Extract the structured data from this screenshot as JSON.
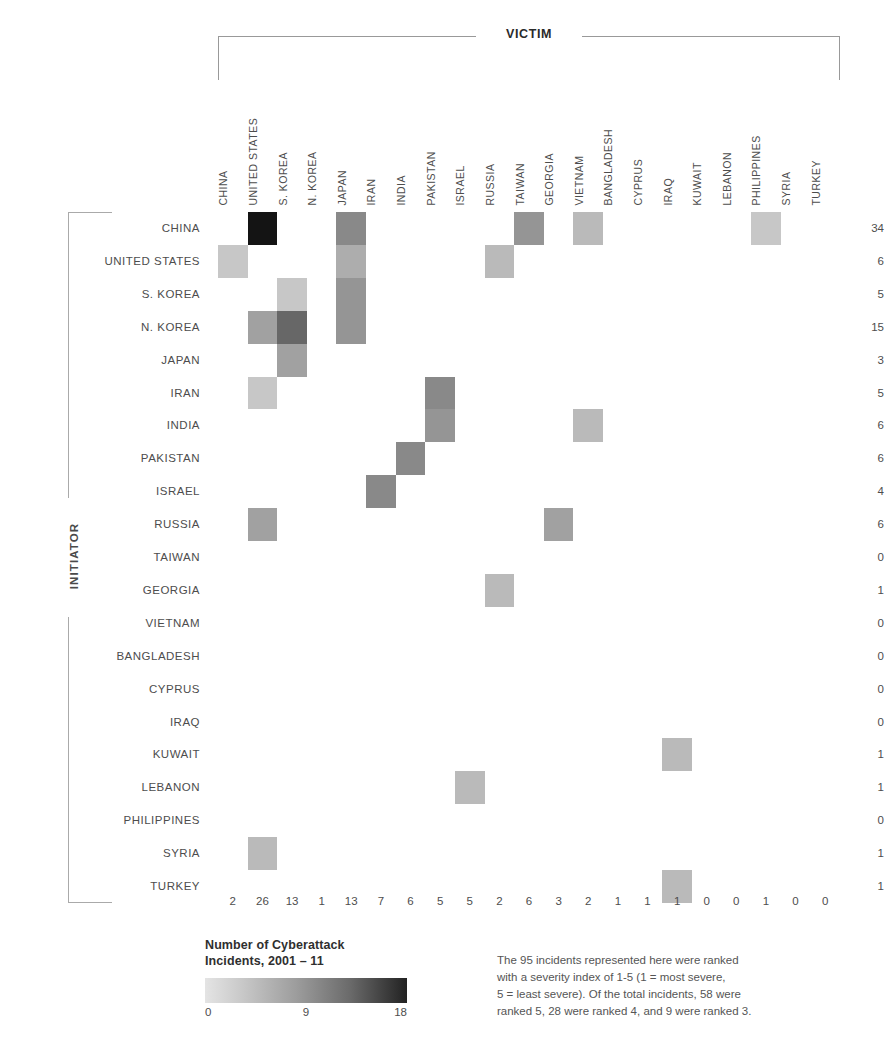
{
  "axes": {
    "victim_label": "VICTIM",
    "initiator_label": "INITIATOR"
  },
  "legend": {
    "title_line1": "Number of Cyberattack",
    "title_line2": "Incidents, 2001 – 11",
    "scale_min": "0",
    "scale_mid": "9",
    "scale_max": "18"
  },
  "footnote": {
    "line1": "The 95 incidents represented here were ranked",
    "line2": "with a severity index of 1-5 (1 = most severe,",
    "line3": "5 = least severe). Of the total incidents, 58 were",
    "line4": "ranked 5, 28 were ranked 4, and 9 were ranked 3."
  },
  "chart_data": {
    "type": "heatmap",
    "title": "Number of Cyberattack Incidents, 2001 – 11",
    "xlabel": "VICTIM",
    "ylabel": "INITIATOR",
    "grid": false,
    "legend_position": "bottom-left",
    "colorscale": {
      "min": 0,
      "mid": 9,
      "max": 18,
      "low_color": "#efefef",
      "high_color": "#1a1a1a"
    },
    "categories": [
      "CHINA",
      "UNITED STATES",
      "S. KOREA",
      "N. KOREA",
      "JAPAN",
      "IRAN",
      "INDIA",
      "PAKISTAN",
      "ISRAEL",
      "RUSSIA",
      "TAIWAN",
      "GEORGIA",
      "VIETNAM",
      "BANGLADESH",
      "CYPRUS",
      "IRAQ",
      "KUWAIT",
      "LEBANON",
      "PHILIPPINES",
      "SYRIA",
      "TURKEY"
    ],
    "rows": [
      "CHINA",
      "UNITED STATES",
      "S. KOREA",
      "N. KOREA",
      "JAPAN",
      "IRAN",
      "INDIA",
      "PAKISTAN",
      "ISRAEL",
      "RUSSIA",
      "TAIWAN",
      "GEORGIA",
      "VIETNAM",
      "BANGLADESH",
      "CYPRUS",
      "IRAQ",
      "KUWAIT",
      "LEBANON",
      "PHILIPPINES",
      "SYRIA",
      "TURKEY"
    ],
    "values": [
      [
        0,
        18,
        0,
        0,
        7,
        0,
        0,
        0,
        0,
        0,
        6,
        0,
        3,
        0,
        0,
        0,
        0,
        0,
        2,
        0,
        0
      ],
      [
        2,
        0,
        0,
        0,
        4,
        0,
        0,
        0,
        0,
        3,
        0,
        0,
        0,
        0,
        0,
        0,
        0,
        0,
        0,
        0,
        0
      ],
      [
        0,
        0,
        2,
        0,
        6,
        0,
        0,
        0,
        0,
        0,
        0,
        0,
        0,
        0,
        0,
        0,
        0,
        0,
        0,
        0,
        0
      ],
      [
        0,
        5,
        10,
        0,
        6,
        0,
        0,
        0,
        0,
        0,
        0,
        0,
        0,
        0,
        0,
        0,
        0,
        0,
        0,
        0,
        0
      ],
      [
        0,
        0,
        5,
        0,
        0,
        0,
        0,
        0,
        0,
        0,
        0,
        0,
        0,
        0,
        0,
        0,
        0,
        0,
        0,
        0,
        0
      ],
      [
        0,
        2,
        0,
        0,
        0,
        0,
        0,
        7,
        0,
        0,
        0,
        0,
        0,
        0,
        0,
        0,
        0,
        0,
        0,
        0,
        0
      ],
      [
        0,
        0,
        0,
        0,
        0,
        0,
        0,
        6,
        0,
        0,
        0,
        0,
        3,
        0,
        0,
        0,
        0,
        0,
        0,
        0,
        0
      ],
      [
        0,
        0,
        0,
        0,
        0,
        0,
        7,
        0,
        0,
        0,
        0,
        0,
        0,
        0,
        0,
        0,
        0,
        0,
        0,
        0,
        0
      ],
      [
        0,
        0,
        0,
        0,
        0,
        7,
        0,
        0,
        0,
        0,
        0,
        0,
        0,
        0,
        0,
        0,
        0,
        0,
        0,
        0,
        0
      ],
      [
        0,
        5,
        0,
        0,
        0,
        0,
        0,
        0,
        0,
        0,
        0,
        5,
        0,
        0,
        0,
        0,
        0,
        0,
        0,
        0,
        0
      ],
      [
        0,
        0,
        0,
        0,
        0,
        0,
        0,
        0,
        0,
        0,
        0,
        0,
        0,
        0,
        0,
        0,
        0,
        0,
        0,
        0,
        0
      ],
      [
        0,
        0,
        0,
        0,
        0,
        0,
        0,
        0,
        0,
        3,
        0,
        0,
        0,
        0,
        0,
        0,
        0,
        0,
        0,
        0,
        0
      ],
      [
        0,
        0,
        0,
        0,
        0,
        0,
        0,
        0,
        0,
        0,
        0,
        0,
        0,
        0,
        0,
        0,
        0,
        0,
        0,
        0,
        0
      ],
      [
        0,
        0,
        0,
        0,
        0,
        0,
        0,
        0,
        0,
        0,
        0,
        0,
        0,
        0,
        0,
        0,
        0,
        0,
        0,
        0,
        0
      ],
      [
        0,
        0,
        0,
        0,
        0,
        0,
        0,
        0,
        0,
        0,
        0,
        0,
        0,
        0,
        0,
        0,
        0,
        0,
        0,
        0,
        0
      ],
      [
        0,
        0,
        0,
        0,
        0,
        0,
        0,
        0,
        0,
        0,
        0,
        0,
        0,
        0,
        0,
        0,
        0,
        0,
        0,
        0,
        0
      ],
      [
        0,
        0,
        0,
        0,
        0,
        0,
        0,
        0,
        0,
        0,
        0,
        0,
        0,
        0,
        0,
        3,
        0,
        0,
        0,
        0,
        0
      ],
      [
        0,
        0,
        0,
        0,
        0,
        0,
        0,
        0,
        3,
        0,
        0,
        0,
        0,
        0,
        0,
        0,
        0,
        0,
        0,
        0,
        0
      ],
      [
        0,
        0,
        0,
        0,
        0,
        0,
        0,
        0,
        0,
        0,
        0,
        0,
        0,
        0,
        0,
        0,
        0,
        0,
        0,
        0,
        0
      ],
      [
        0,
        3,
        0,
        0,
        0,
        0,
        0,
        0,
        0,
        0,
        0,
        0,
        0,
        0,
        0,
        0,
        0,
        0,
        0,
        0,
        0
      ],
      [
        0,
        0,
        0,
        0,
        0,
        0,
        0,
        0,
        0,
        0,
        0,
        0,
        0,
        0,
        0,
        3,
        0,
        0,
        0,
        0,
        0
      ]
    ],
    "row_totals": [
      34,
      6,
      5,
      15,
      3,
      5,
      6,
      6,
      4,
      6,
      0,
      1,
      0,
      0,
      0,
      0,
      1,
      1,
      0,
      1,
      1
    ],
    "column_totals": [
      2,
      26,
      13,
      1,
      13,
      7,
      6,
      5,
      5,
      2,
      6,
      3,
      2,
      1,
      1,
      1,
      0,
      0,
      1,
      0,
      0
    ],
    "total_incidents": 95
  }
}
